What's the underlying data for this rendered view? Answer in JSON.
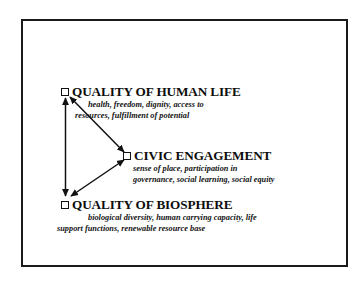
{
  "figure": {
    "type": "diagram",
    "title": "",
    "frame": {
      "border_color": "#1a1a1a",
      "background": "#ffffff"
    },
    "nodes": [
      {
        "id": "quality-of-human-life",
        "bullet": "square-bullet-icon",
        "title": "QUALITY OF HUMAN LIFE",
        "description_lines": [
          "health, freedom, dignity, access to",
          "resources, fulfillment of potential"
        ]
      },
      {
        "id": "civic-engagement",
        "bullet": "square-bullet-icon",
        "title": "CIVIC ENGAGEMENT",
        "description_lines": [
          "sense of place, participation in",
          "governance, social learning, social equity"
        ]
      },
      {
        "id": "quality-of-biosphere",
        "bullet": "square-bullet-icon",
        "title": "QUALITY OF BIOSPHERE",
        "description_lines": [
          "biological diversity, human carrying capacity, life",
          "support functions, renewable resource base"
        ]
      }
    ],
    "connectors": [
      {
        "id": "human-life-to-biosphere",
        "from": "quality-of-human-life",
        "to": "quality-of-biosphere",
        "style": "double-headed-arrow",
        "color": "#111111"
      },
      {
        "id": "human-life-to-civic-engagement",
        "from": "quality-of-human-life",
        "to": "civic-engagement",
        "style": "double-headed-arrow",
        "color": "#111111"
      },
      {
        "id": "biosphere-to-civic-engagement",
        "from": "quality-of-biosphere",
        "to": "civic-engagement",
        "style": "double-headed-arrow",
        "color": "#111111"
      }
    ]
  }
}
